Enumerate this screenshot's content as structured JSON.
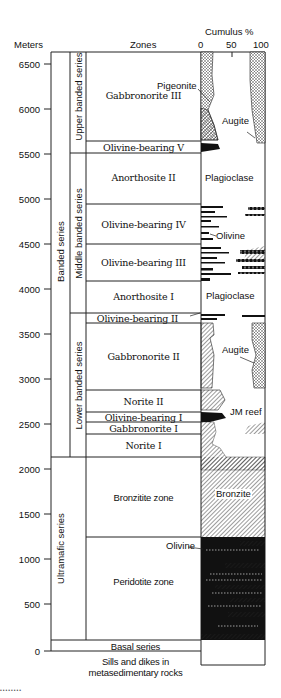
{
  "header": {
    "y_axis_title": "Meters",
    "zones_title": "Zones",
    "cumulus_title": "Cumulus %",
    "cumulus_ticks": [
      "0",
      "50",
      "100"
    ]
  },
  "y_axis": {
    "ticks": [
      {
        "value": 6500,
        "label": "6500"
      },
      {
        "value": 6000,
        "label": "6000"
      },
      {
        "value": 5500,
        "label": "5500"
      },
      {
        "value": 5000,
        "label": "5000"
      },
      {
        "value": 4500,
        "label": "4500"
      },
      {
        "value": 4000,
        "label": "4000"
      },
      {
        "value": 3500,
        "label": "3500"
      },
      {
        "value": 3000,
        "label": "3000"
      },
      {
        "value": 2500,
        "label": "2500"
      },
      {
        "value": 2000,
        "label": "2000"
      },
      {
        "value": 1500,
        "label": "1500"
      },
      {
        "value": 1000,
        "label": "1000"
      },
      {
        "value": 500,
        "label": "500"
      },
      {
        "value": 0,
        "label": "0"
      }
    ]
  },
  "series": {
    "major": [
      {
        "name": "Banded series",
        "top_m": 6600,
        "bottom_m": 2150
      },
      {
        "name": "Ultramafic series",
        "top_m": 2150,
        "bottom_m": 120
      }
    ],
    "sub": [
      {
        "name": "Upper banded series",
        "top_m": 6600,
        "bottom_m": 5480
      },
      {
        "name": "Middle banded series",
        "top_m": 5480,
        "bottom_m": 3740
      },
      {
        "name": "Lower banded series",
        "top_m": 3740,
        "bottom_m": 2150
      }
    ]
  },
  "zones": [
    {
      "name": "Gabbronorite III",
      "top_m": 6600,
      "bottom_m": 5620
    },
    {
      "name": "Olivine-bearing V",
      "top_m": 5620,
      "bottom_m": 5480
    },
    {
      "name": "Anorthosite II",
      "top_m": 5480,
      "bottom_m": 4910
    },
    {
      "name": "Olivine-bearing IV",
      "top_m": 4910,
      "bottom_m": 4470
    },
    {
      "name": "Olivine-bearing III",
      "top_m": 4470,
      "bottom_m": 4060
    },
    {
      "name": "Anorthosite I",
      "top_m": 4060,
      "bottom_m": 3740
    },
    {
      "name": "Olivine-bearing II",
      "top_m": 3740,
      "bottom_m": 3600
    },
    {
      "name": "Gabbronorite II",
      "top_m": 3600,
      "bottom_m": 2860
    },
    {
      "name": "Norite II",
      "top_m": 2860,
      "bottom_m": 2630
    },
    {
      "name": "Olivine-bearing I",
      "top_m": 2630,
      "bottom_m": 2520
    },
    {
      "name": "Gabbronorite I",
      "top_m": 2520,
      "bottom_m": 2390
    },
    {
      "name": "Norite I",
      "top_m": 2390,
      "bottom_m": 2150
    },
    {
      "name": "Bronzitite zone",
      "top_m": 2150,
      "bottom_m": 1260
    },
    {
      "name": "Peridotite zone",
      "top_m": 1260,
      "bottom_m": 120
    },
    {
      "name": "Basal series",
      "top_m": 120,
      "bottom_m": 0
    }
  ],
  "base_label_line1": "Sills and dikes in",
  "base_label_line2": "metasedimentary rocks",
  "mineral_labels": {
    "pigeonite": "Pigeonite",
    "augite_upper": "Augite",
    "plagioclase_upper": "Plagioclase",
    "olivine_middle": "Olivine",
    "plagioclase_lower": "Plagioclase",
    "augite_lower": "Augite",
    "jm_reef": "JM reef",
    "bronzite": "Bronzite",
    "olivine_ultramafic": "Olivine"
  },
  "footer_dots": "••••••••"
}
